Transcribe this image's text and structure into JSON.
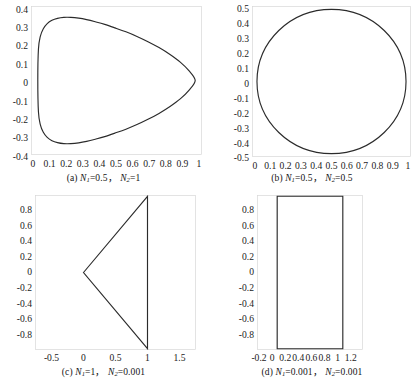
{
  "figure": {
    "panel_count": 4,
    "line_color": "#2b2b2b",
    "frame_color": "#d8d8d8",
    "background": "#ffffff"
  },
  "panels": {
    "a": {
      "label": "(a)",
      "caption_n1_symbol": "N",
      "caption_n1_sub": "1",
      "caption_n1_value": "=0.5",
      "caption_sep": "，",
      "caption_n2_symbol": "N",
      "caption_n2_sub": "2",
      "caption_n2_value": "=1",
      "caption_full": "(a) N1=0.5, N2=1",
      "xticks": [
        "0",
        "0.1",
        "0.2",
        "0.3",
        "0.4",
        "0.5",
        "0.6",
        "0.7",
        "0.8",
        "0.9",
        "1"
      ],
      "yticks": [
        "0.4",
        "0.3",
        "0.2",
        "0.1",
        "0",
        "-0.1",
        "-0.2",
        "-0.3",
        "-0.4"
      ]
    },
    "b": {
      "label": "(b)",
      "caption_n1_symbol": "N",
      "caption_n1_sub": "1",
      "caption_n1_value": "=0.5",
      "caption_sep": "，",
      "caption_n2_symbol": "N",
      "caption_n2_sub": "2",
      "caption_n2_value": "=0.5",
      "caption_full": "(b) N1=0.5, N2=0.5",
      "xticks": [
        "0",
        "0.1",
        "0.2",
        "0.3",
        "0.4",
        "0.5",
        "0.6",
        "0.7",
        "0.8",
        "0.9",
        "1"
      ],
      "yticks": [
        "0.5",
        "0.4",
        "0.3",
        "0.2",
        "0.1",
        "0",
        "-0.1",
        "-0.2",
        "-0.3",
        "-0.4",
        "-0.5"
      ]
    },
    "c": {
      "label": "(c)",
      "caption_n1_symbol": "N",
      "caption_n1_sub": "1",
      "caption_n1_value": "=1",
      "caption_sep": "，",
      "caption_n2_symbol": "N",
      "caption_n2_sub": "2",
      "caption_n2_value": "=0.001",
      "caption_full": "(c) N1=1, N2=0.001",
      "xticks": [
        "-0.5",
        "0",
        "0.5",
        "1",
        "1.5"
      ],
      "yticks": [
        "0.8",
        "0.6",
        "0.4",
        "0.2",
        "0",
        "-0.2",
        "-0.4",
        "-0.6",
        "-0.8"
      ]
    },
    "d": {
      "label": "(d)",
      "caption_n1_symbol": "N",
      "caption_n1_sub": "1",
      "caption_n1_value": "=0.001",
      "caption_sep": "，",
      "caption_n2_symbol": "N",
      "caption_n2_sub": "2",
      "caption_n2_value": "=0.001",
      "caption_full": "(d) N1=0.001, N2=0.001",
      "xticks": [
        "-0.2",
        "0",
        "0.2",
        "0.4",
        "0.6",
        "0.8",
        "1",
        "1.2"
      ],
      "yticks": [
        "0.8",
        "0.6",
        "0.4",
        "0.2",
        "0",
        "-0.2",
        "-0.4",
        "-0.6",
        "-0.8"
      ]
    }
  },
  "chart_data": [
    {
      "id": "a",
      "type": "line",
      "title": "(a) N1=0.5, N2=1",
      "xlabel": "",
      "ylabel": "",
      "xlim": [
        -0.04,
        1.04
      ],
      "ylim": [
        -0.45,
        0.45
      ],
      "grid": false,
      "legend": "none",
      "shape": "teardrop-cardioid",
      "xticks": [
        0,
        0.1,
        0.2,
        0.3,
        0.4,
        0.5,
        0.6,
        0.7,
        0.8,
        0.9,
        1
      ],
      "yticks": [
        0.4,
        0.3,
        0.2,
        0.1,
        0,
        -0.1,
        -0.2,
        -0.3,
        -0.4
      ],
      "series": [
        {
          "name": "curve",
          "closed": true,
          "x": [
            1.0,
            0.96,
            0.905,
            0.84,
            0.77,
            0.7,
            0.63,
            0.56,
            0.49,
            0.425,
            0.365,
            0.31,
            0.26,
            0.21,
            0.165,
            0.125,
            0.09,
            0.06,
            0.035,
            0.016,
            0.004,
            0.0,
            0.004,
            0.016,
            0.035,
            0.06,
            0.09,
            0.125,
            0.165,
            0.21,
            0.26,
            0.31,
            0.365,
            0.425,
            0.49,
            0.56,
            0.63,
            0.7,
            0.77,
            0.84,
            0.905,
            0.96,
            1.0
          ],
          "y": [
            0.0,
            0.06,
            0.112,
            0.158,
            0.2,
            0.236,
            0.268,
            0.296,
            0.32,
            0.341,
            0.357,
            0.37,
            0.379,
            0.384,
            0.384,
            0.378,
            0.366,
            0.346,
            0.315,
            0.268,
            0.19,
            0.0,
            -0.19,
            -0.268,
            -0.315,
            -0.346,
            -0.366,
            -0.378,
            -0.384,
            -0.384,
            -0.379,
            -0.37,
            -0.357,
            -0.341,
            -0.32,
            -0.296,
            -0.268,
            -0.236,
            -0.2,
            -0.158,
            -0.112,
            -0.06,
            0.0
          ]
        }
      ]
    },
    {
      "id": "b",
      "type": "line",
      "title": "(b) N1=0.5, N2=0.5",
      "xlabel": "",
      "ylabel": "",
      "xlim": [
        -0.03,
        1.03
      ],
      "ylim": [
        -0.52,
        0.52
      ],
      "grid": false,
      "legend": "none",
      "shape": "circle",
      "xticks": [
        0,
        0.1,
        0.2,
        0.3,
        0.4,
        0.5,
        0.6,
        0.7,
        0.8,
        0.9,
        1
      ],
      "yticks": [
        0.5,
        0.4,
        0.3,
        0.2,
        0.1,
        0,
        -0.1,
        -0.2,
        -0.3,
        -0.4,
        -0.5
      ],
      "series": [
        {
          "name": "curve",
          "closed": true,
          "circle": {
            "cx": 0.5,
            "cy": 0.0,
            "r": 0.5
          }
        }
      ]
    },
    {
      "id": "c",
      "type": "line",
      "title": "(c) N1=1, N2=0.001",
      "xlabel": "",
      "ylabel": "",
      "xlim": [
        -0.75,
        1.75
      ],
      "ylim": [
        -0.97,
        0.97
      ],
      "grid": false,
      "legend": "none",
      "shape": "triangle",
      "xticks": [
        -0.5,
        0,
        0.5,
        1,
        1.5
      ],
      "yticks": [
        0.8,
        0.6,
        0.4,
        0.2,
        0,
        -0.2,
        -0.4,
        -0.6,
        -0.8
      ],
      "series": [
        {
          "name": "curve",
          "closed": true,
          "x": [
            0.0,
            1.0,
            1.0,
            0.0
          ],
          "y": [
            0.0,
            0.96,
            -0.96,
            0.0
          ]
        }
      ]
    },
    {
      "id": "d",
      "type": "line",
      "title": "(d) N1=0.001, N2=0.001",
      "xlabel": "",
      "ylabel": "",
      "xlim": [
        -0.3,
        1.3
      ],
      "ylim": [
        -0.97,
        0.97
      ],
      "grid": false,
      "legend": "none",
      "shape": "rectangle",
      "xticks": [
        -0.2,
        0,
        0.2,
        0.4,
        0.6,
        0.8,
        1,
        1.2
      ],
      "yticks": [
        0.8,
        0.6,
        0.4,
        0.2,
        0,
        -0.2,
        -0.4,
        -0.6,
        -0.8
      ],
      "series": [
        {
          "name": "curve",
          "closed": true,
          "x": [
            0.0,
            1.0,
            1.0,
            0.0,
            0.0
          ],
          "y": [
            0.96,
            0.96,
            -0.96,
            -0.96,
            0.96
          ]
        }
      ]
    }
  ]
}
